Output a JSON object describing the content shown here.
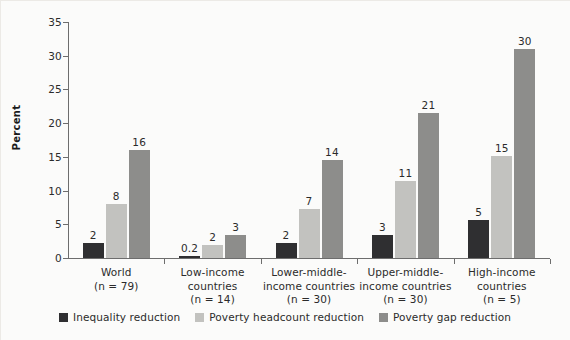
{
  "chart_data": {
    "type": "bar",
    "title": "",
    "xlabel": "",
    "ylabel": "Percent",
    "ylim": [
      0,
      35
    ],
    "yticks": [
      "0",
      "5",
      "10",
      "15",
      "20",
      "25",
      "30",
      "35"
    ],
    "grid": false,
    "legend_position": "bottom",
    "categories": [
      "World\n(n = 79)",
      "Low-income countries\n(n = 14)",
      "Lower-middle-income countries\n(n = 30)",
      "Upper-middle-income countries\n(n = 30)",
      "High-income countries\n(n = 5)"
    ],
    "category_lines": [
      [
        "World",
        "(n = 79)"
      ],
      [
        "Low-income",
        "countries",
        "(n = 14)"
      ],
      [
        "Lower-middle-",
        "income countries",
        "(n = 30)"
      ],
      [
        "Upper-middle-",
        "income countries",
        "(n = 30)"
      ],
      [
        "High-income",
        "countries",
        "(n = 5)"
      ]
    ],
    "series": [
      {
        "name": "Inequality reduction",
        "color": "#2f2f31",
        "values": [
          2,
          0.2,
          2,
          3,
          5
        ],
        "labels": [
          "2",
          "0.2",
          "2",
          "3",
          "5"
        ],
        "plot_values": [
          2.3,
          0.25,
          2.2,
          3.4,
          5.6
        ]
      },
      {
        "name": "Poverty headcount reduction",
        "color": "#c2c2bf",
        "values": [
          8,
          2,
          7,
          11,
          15
        ],
        "labels": [
          "8",
          "2",
          "7",
          "11",
          "15"
        ],
        "plot_values": [
          8.0,
          1.9,
          7.3,
          11.4,
          15.1
        ]
      },
      {
        "name": "Poverty gap reduction",
        "color": "#8d8d8b",
        "values": [
          16,
          3,
          14,
          21,
          30
        ],
        "labels": [
          "16",
          "3",
          "14",
          "21",
          "30"
        ],
        "plot_values": [
          16.0,
          3.4,
          14.6,
          21.5,
          31.0
        ]
      }
    ]
  },
  "legend": {
    "items": [
      {
        "label": "Inequality reduction",
        "color": "#2f2f31"
      },
      {
        "label": "Poverty headcount reduction",
        "color": "#c2c2bf"
      },
      {
        "label": "Poverty gap reduction",
        "color": "#8d8d8b"
      }
    ]
  },
  "axis": {
    "y_title": "Percent"
  }
}
